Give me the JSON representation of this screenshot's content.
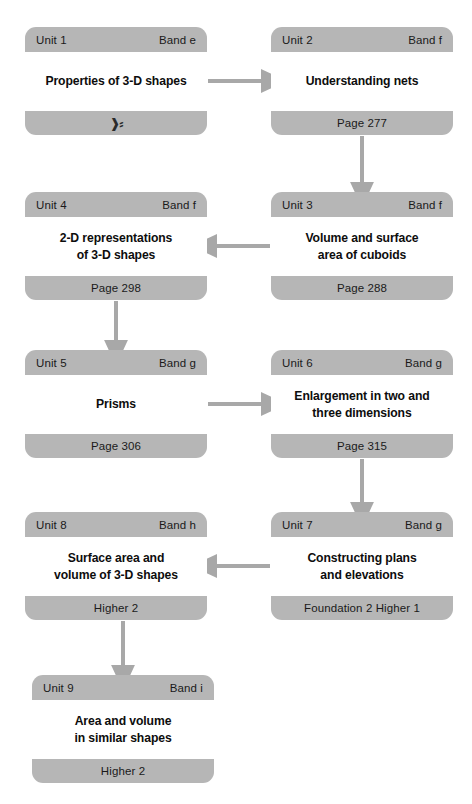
{
  "diagram": {
    "colors": {
      "card_frame": "#b6b6b6",
      "card_body": "#ffffff",
      "arrow": "#a8a8a8",
      "text": "#1a1a1a",
      "page_background": "#ffffff"
    }
  },
  "units": [
    {
      "id": "unit-1",
      "unit_label": "Unit 1",
      "band_label": "Band e",
      "title": "Properties of 3-D shapes",
      "footer": "❱⸗",
      "footer_kind": "corrupt-glyph",
      "x": 25,
      "y": 27
    },
    {
      "id": "unit-2",
      "unit_label": "Unit 2",
      "band_label": "Band f",
      "title": "Understanding nets",
      "footer": "Page 277",
      "footer_kind": "page",
      "x": 271,
      "y": 27
    },
    {
      "id": "unit-4",
      "unit_label": "Unit 4",
      "band_label": "Band f",
      "title": "2-D representations\nof 3-D shapes",
      "footer": "Page 298",
      "footer_kind": "page",
      "x": 25,
      "y": 192
    },
    {
      "id": "unit-3",
      "unit_label": "Unit 3",
      "band_label": "Band f",
      "title": "Volume and surface\narea of cuboids",
      "footer": "Page 288",
      "footer_kind": "page",
      "x": 271,
      "y": 192
    },
    {
      "id": "unit-5",
      "unit_label": "Unit 5",
      "band_label": "Band g",
      "title": "Prisms",
      "footer": "Page 306",
      "footer_kind": "page",
      "x": 25,
      "y": 350
    },
    {
      "id": "unit-6",
      "unit_label": "Unit 6",
      "band_label": "Band g",
      "title": "Enlargement in two and\nthree dimensions",
      "footer": "Page 315",
      "footer_kind": "page",
      "x": 271,
      "y": 350
    },
    {
      "id": "unit-8",
      "unit_label": "Unit 8",
      "band_label": "Band h",
      "title": "Surface area and\nvolume of 3-D shapes",
      "footer": "Higher 2",
      "footer_kind": "page",
      "x": 25,
      "y": 512
    },
    {
      "id": "unit-7",
      "unit_label": "Unit 7",
      "band_label": "Band g",
      "title": "Constructing plans\nand elevations",
      "footer": "Foundation 2 Higher 1",
      "footer_kind": "page",
      "x": 271,
      "y": 512
    },
    {
      "id": "unit-9",
      "unit_label": "Unit 9",
      "band_label": "Band i",
      "title": "Area and volume\nin similar shapes",
      "footer": "Higher 2",
      "footer_kind": "page",
      "x": 32,
      "y": 675
    }
  ],
  "connectors": [
    {
      "id": "unit1-to-unit2",
      "from": "unit-1",
      "to": "unit-2",
      "direction": "right"
    },
    {
      "id": "unit2-to-unit3",
      "from": "unit-2",
      "to": "unit-3",
      "direction": "down"
    },
    {
      "id": "unit3-to-unit4",
      "from": "unit-3",
      "to": "unit-4",
      "direction": "left"
    },
    {
      "id": "unit4-to-unit5",
      "from": "unit-4",
      "to": "unit-5",
      "direction": "down"
    },
    {
      "id": "unit5-to-unit6",
      "from": "unit-5",
      "to": "unit-6",
      "direction": "right"
    },
    {
      "id": "unit6-to-unit7",
      "from": "unit-6",
      "to": "unit-7",
      "direction": "down"
    },
    {
      "id": "unit7-to-unit8",
      "from": "unit-7",
      "to": "unit-8",
      "direction": "left"
    },
    {
      "id": "unit8-to-unit9",
      "from": "unit-8",
      "to": "unit-9",
      "direction": "down"
    }
  ]
}
